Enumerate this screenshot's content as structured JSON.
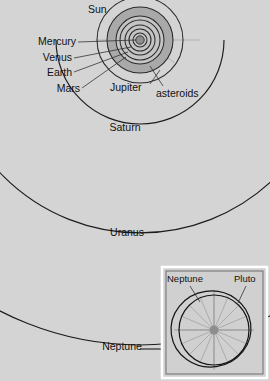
{
  "figure": {
    "kind": "solar-system-orbit-diagram",
    "background_color": "#d4d4d4",
    "orbit_line_color": "#1c1c1c",
    "asteroid_belt_color": "#a9a9a9",
    "sun_color": "#8e8e8e",
    "center": {
      "x": 140,
      "y": 40
    }
  },
  "main_diagram": {
    "labels": {
      "sun": "Sun",
      "mercury": "Mercury",
      "venus": "Venus",
      "earth": "Earth",
      "mars": "Mars",
      "jupiter": "Jupiter",
      "asteroids": "asteroids",
      "saturn": "Saturn",
      "uranus": "Uranus",
      "neptune": "Neptune"
    },
    "orbits": [
      {
        "name": "Mercury",
        "radius_px": 7
      },
      {
        "name": "Venus",
        "radius_px": 11
      },
      {
        "name": "Earth",
        "radius_px": 15
      },
      {
        "name": "Mars",
        "radius_px": 20
      },
      {
        "name": "asteroid belt inner",
        "radius_px": 24
      },
      {
        "name": "asteroid belt outer",
        "radius_px": 33
      },
      {
        "name": "Jupiter",
        "radius_px": 43
      },
      {
        "name": "Saturn",
        "radius_px": 84
      },
      {
        "name": "Uranus",
        "radius_px": 193
      },
      {
        "name": "Neptune",
        "radius_px": 305
      }
    ]
  },
  "inset": {
    "title_labels": {
      "neptune": "Neptune",
      "pluto": "Pluto"
    },
    "box": {
      "x": 162,
      "y": 267,
      "width": 105,
      "height": 111
    },
    "orbits": [
      {
        "name": "Neptune",
        "shape": "near-circular",
        "rx": 36,
        "ry": 36,
        "cx": 214,
        "cy": 330
      },
      {
        "name": "Pluto",
        "shape": "eccentric-ellipse",
        "rx": 40,
        "ry": 38,
        "cx": 211,
        "cy": 329
      }
    ],
    "spoke_count": 16
  }
}
